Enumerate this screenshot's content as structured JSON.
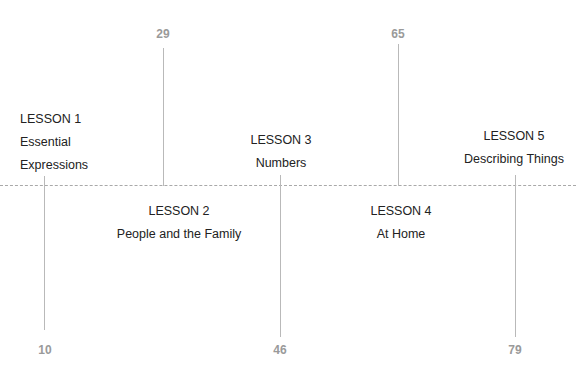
{
  "timeline": {
    "lessons": [
      {
        "title": "LESSON 1",
        "subtitle_line1": "Essential",
        "subtitle_line2": "Expressions",
        "number": "10",
        "position": "above"
      },
      {
        "title": "LESSON 2",
        "subtitle": "People and the Family",
        "number": "29",
        "position": "below"
      },
      {
        "title": "LESSON 3",
        "subtitle": "Numbers",
        "number": "46",
        "position": "above"
      },
      {
        "title": "LESSON 4",
        "subtitle": "At Home",
        "number": "65",
        "position": "below"
      },
      {
        "title": "LESSON 5",
        "subtitle": "Describing Things",
        "number": "79",
        "position": "above"
      }
    ]
  },
  "colors": {
    "stem": "#b9b9b9",
    "number": "#9a9a9a",
    "text": "#222222",
    "axis": "#a9a9a9"
  }
}
